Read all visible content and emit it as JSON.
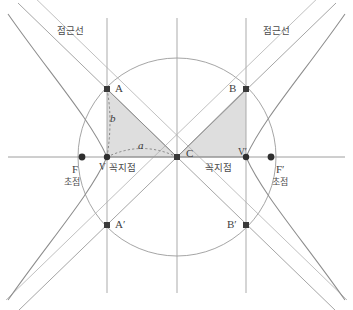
{
  "figure": {
    "background_color": "#ffffff",
    "line_color": "#8c8c8c",
    "axis_color": "#9a9a9a",
    "curve_color": "#8a8a8a",
    "marker_color": "#3a3a3a",
    "shade_color": "#d9d9d9",
    "dashed_color": "#707070",
    "text_color": "#4a4a4a"
  },
  "labels": {
    "asymptote_left": "점근선",
    "asymptote_right": "점근선",
    "focus_left_point": "F",
    "focus_left_name": "초점",
    "focus_right_point": "F′",
    "focus_right_name": "초점",
    "vertex_left_point": "V",
    "vertex_left_name": "꼭지점",
    "vertex_right_point": "V′",
    "vertex_right_name": "꼭지점",
    "point_a": "A",
    "point_b": "B",
    "point_a_prime": "A′",
    "point_b_prime": "B′",
    "center": "C",
    "semi_major": "a",
    "semi_minor": "b"
  },
  "geometry": {
    "center": {
      "x": 177,
      "y": 157
    },
    "circle_radius": 99,
    "semi_major_a": 70,
    "semi_minor_b": 68,
    "focal_distance_c": 95,
    "asymptote_slope": 0.97,
    "vertices": [
      {
        "name": "V",
        "x": 107,
        "y": 157
      },
      {
        "name": "V′",
        "x": 246,
        "y": 157
      }
    ],
    "foci": [
      {
        "name": "F",
        "x": 82,
        "y": 157
      },
      {
        "name": "F′",
        "x": 271,
        "y": 157
      }
    ],
    "rectangle_corners": [
      {
        "name": "A",
        "x": 107,
        "y": 89
      },
      {
        "name": "B",
        "x": 246,
        "y": 89
      },
      {
        "name": "A′",
        "x": 107,
        "y": 225
      },
      {
        "name": "B′",
        "x": 246,
        "y": 225
      }
    ],
    "vertical_line_x": [
      107,
      177,
      246
    ],
    "vertical_line_top": 18,
    "vertical_line_bottom": 293,
    "horizontal_axis_y": 157
  }
}
